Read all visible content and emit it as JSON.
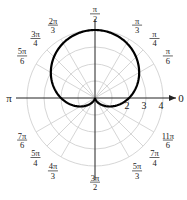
{
  "chart_data": {
    "type": "line",
    "subtype": "polar",
    "title": "",
    "equation": "r = 2 + 2 sin(theta)",
    "series": [
      {
        "name": "cardioid",
        "function": "2+2*sin(theta)",
        "theta_range": [
          0,
          6.2832
        ],
        "color": "#000000"
      }
    ],
    "key_points": [
      {
        "theta": "0",
        "r": 2
      },
      {
        "theta": "π/2",
        "r": 4
      },
      {
        "theta": "π",
        "r": 2
      },
      {
        "theta": "3π/2",
        "r": 0
      }
    ],
    "rlim": [
      0,
      4
    ],
    "radial_ticks": [
      1,
      2,
      3,
      4
    ],
    "radial_tick_labels": [
      "2",
      "3",
      "4"
    ],
    "grid": true,
    "grid_color": "#d6d6d6",
    "angle_axis_labels": {
      "zero": "0",
      "pi": "π"
    },
    "angle_labels": [
      {
        "num": "π",
        "den": "6",
        "angle_deg": 30
      },
      {
        "num": "π",
        "den": "4",
        "angle_deg": 45
      },
      {
        "num": "π",
        "den": "3",
        "angle_deg": 60
      },
      {
        "num": "π",
        "den": "2",
        "angle_deg": 90
      },
      {
        "num": "2π",
        "den": "3",
        "angle_deg": 120
      },
      {
        "num": "3π",
        "den": "4",
        "angle_deg": 135
      },
      {
        "num": "5π",
        "den": "6",
        "angle_deg": 150
      },
      {
        "num": "7π",
        "den": "6",
        "angle_deg": 210
      },
      {
        "num": "5π",
        "den": "4",
        "angle_deg": 225
      },
      {
        "num": "4π",
        "den": "3",
        "angle_deg": 240
      },
      {
        "num": "3π",
        "den": "2",
        "angle_deg": 270
      },
      {
        "num": "5π",
        "den": "3",
        "angle_deg": 300
      },
      {
        "num": "7π",
        "den": "4",
        "angle_deg": 315
      },
      {
        "num": "11π",
        "den": "6",
        "angle_deg": 330
      }
    ]
  }
}
